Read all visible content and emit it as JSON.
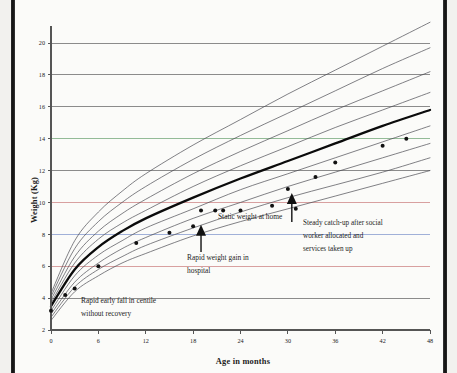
{
  "figure": {
    "domain": "chart",
    "caption_visible": false
  },
  "axes": {
    "y_title": "Weight (Kg)",
    "x_title": "Age in months",
    "y_ticks": [
      2,
      4,
      6,
      8,
      10,
      12,
      14,
      16,
      18,
      20
    ],
    "x_ticks": [
      0,
      6,
      12,
      18,
      24,
      30,
      36,
      42,
      48
    ],
    "y_min": 2,
    "y_max": 20,
    "x_min": 0,
    "x_max": 48
  },
  "annotations": [
    {
      "name": "rapid-early-fall",
      "lines": [
        "Rapid early fall in centile",
        "without recovery"
      ],
      "has_arrow": false
    },
    {
      "name": "rapid-weight-gain",
      "lines": [
        "Rapid weight gain in",
        "hospital"
      ],
      "has_arrow": true,
      "arrow_points_to_months": 19,
      "arrow_points_to_kg": 8.6
    },
    {
      "name": "static-weight-at-home",
      "lines": [
        "Static weight at home"
      ],
      "has_arrow": false
    },
    {
      "name": "steady-catch-up",
      "lines": [
        "Steady catch-up after social",
        "worker allocated and",
        "services taken up"
      ],
      "has_arrow": true,
      "arrow_points_to_months": 30.5,
      "arrow_points_to_kg": 10.6
    }
  ],
  "colors": {
    "centile_line": "#4a4a52",
    "median_line": "#0b0b0b",
    "grid_plain": "#6f6f6f",
    "grid_purple": "#8e63a8",
    "grid_green": "#8fc98f",
    "grid_red": "#d08a8a",
    "grid_blue": "#8a9ed0",
    "point": "#111111",
    "text": "#1d1d1d"
  },
  "chart_data": {
    "type": "line",
    "title": "",
    "subtitle": "",
    "xlabel": "Age in months",
    "ylabel": "Weight (Kg)",
    "xlim": [
      0,
      48
    ],
    "ylim": [
      2,
      20
    ],
    "grid": true,
    "legend_position": "none",
    "x_tick_labels": [
      "0",
      "6",
      "12",
      "18",
      "24",
      "30",
      "36",
      "42",
      "48"
    ],
    "y_tick_labels": [
      "2",
      "4",
      "6",
      "8",
      "10",
      "12",
      "14",
      "16",
      "18",
      "20"
    ],
    "series": [
      {
        "name": "99.6th centile",
        "type": "line",
        "style": "thin",
        "x": [
          0,
          3,
          6,
          9,
          12,
          18,
          24,
          30,
          36,
          42,
          48
        ],
        "values": [
          4.3,
          7.6,
          9.4,
          10.7,
          11.8,
          13.6,
          15.2,
          16.8,
          18.3,
          19.8,
          21.3
        ]
      },
      {
        "name": "98th centile",
        "type": "line",
        "style": "thin",
        "x": [
          0,
          3,
          6,
          9,
          12,
          18,
          24,
          30,
          36,
          42,
          48
        ],
        "values": [
          4.1,
          7.1,
          8.8,
          10.0,
          11.0,
          12.7,
          14.2,
          15.6,
          17.0,
          18.4,
          19.7
        ]
      },
      {
        "name": "91st centile",
        "type": "line",
        "style": "thin",
        "x": [
          0,
          3,
          6,
          9,
          12,
          18,
          24,
          30,
          36,
          42,
          48
        ],
        "values": [
          3.9,
          6.6,
          8.2,
          9.3,
          10.2,
          11.8,
          13.2,
          14.5,
          15.8,
          17.0,
          18.2
        ]
      },
      {
        "name": "75th centile",
        "type": "line",
        "style": "thin",
        "x": [
          0,
          3,
          6,
          9,
          12,
          18,
          24,
          30,
          36,
          42,
          48
        ],
        "values": [
          3.7,
          6.2,
          7.7,
          8.7,
          9.5,
          11.0,
          12.3,
          13.5,
          14.7,
          15.8,
          16.9
        ]
      },
      {
        "name": "50th centile",
        "type": "line",
        "style": "bold",
        "x": [
          0,
          3,
          6,
          9,
          12,
          18,
          24,
          30,
          36,
          42,
          48
        ],
        "values": [
          3.5,
          5.8,
          7.2,
          8.2,
          9.0,
          10.3,
          11.5,
          12.6,
          13.7,
          14.8,
          15.8
        ]
      },
      {
        "name": "25th centile",
        "type": "line",
        "style": "thin",
        "x": [
          0,
          3,
          6,
          9,
          12,
          18,
          24,
          30,
          36,
          42,
          48
        ],
        "values": [
          3.2,
          5.4,
          6.7,
          7.6,
          8.4,
          9.6,
          10.8,
          11.8,
          12.8,
          13.8,
          14.8
        ]
      },
      {
        "name": "9th centile",
        "type": "line",
        "style": "thin",
        "x": [
          0,
          3,
          6,
          9,
          12,
          18,
          24,
          30,
          36,
          42,
          48
        ],
        "values": [
          3.0,
          5.0,
          6.2,
          7.1,
          7.8,
          9.0,
          10.0,
          11.0,
          11.9,
          12.8,
          13.7
        ]
      },
      {
        "name": "2nd centile",
        "type": "line",
        "style": "thin",
        "x": [
          0,
          3,
          6,
          9,
          12,
          18,
          24,
          30,
          36,
          42,
          48
        ],
        "values": [
          2.8,
          4.7,
          5.8,
          6.6,
          7.3,
          8.4,
          9.4,
          10.3,
          11.1,
          11.9,
          12.8
        ]
      },
      {
        "name": "0.4th centile",
        "type": "line",
        "style": "thin",
        "x": [
          0,
          3,
          6,
          9,
          12,
          18,
          24,
          30,
          36,
          42,
          48
        ],
        "values": [
          2.6,
          4.4,
          5.4,
          6.2,
          6.8,
          7.9,
          8.8,
          9.6,
          10.4,
          11.2,
          12.0
        ]
      },
      {
        "name": "Child measured weight",
        "type": "scatter",
        "style": "points",
        "x": [
          0,
          1.8,
          3,
          6,
          10.8,
          15,
          18,
          19,
          20.8,
          21.8,
          24,
          28,
          30,
          31,
          33.5,
          36,
          42,
          45
        ],
        "values": [
          3.2,
          4.2,
          4.6,
          6.0,
          7.45,
          8.1,
          8.5,
          9.5,
          9.5,
          9.5,
          9.5,
          9.8,
          10.85,
          9.6,
          11.6,
          12.5,
          13.55,
          14.0
        ]
      }
    ],
    "horizontal_reference_lines": [
      {
        "kg": 20,
        "color": "#6f6f6f"
      },
      {
        "kg": 18,
        "color": "#6f6f6f"
      },
      {
        "kg": 16,
        "color": "#6f6f6f"
      },
      {
        "kg": 14,
        "color": "#8e63a8"
      },
      {
        "kg": 14,
        "color": "#8fc98f"
      },
      {
        "kg": 12,
        "color": "#6f6f6f"
      },
      {
        "kg": 10,
        "color": "#d08a8a"
      },
      {
        "kg": 8,
        "color": "#8a9ed0"
      },
      {
        "kg": 6,
        "color": "#d08a8a"
      },
      {
        "kg": 4,
        "color": "#6f6f6f"
      }
    ]
  }
}
